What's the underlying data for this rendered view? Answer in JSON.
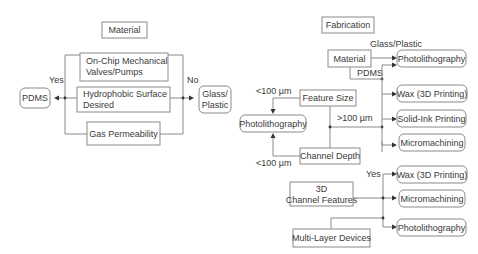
{
  "left_panel": {
    "title": "Material",
    "criteria": [
      {
        "line1": "On-Chip Mechanical",
        "line2": "Valves/Pumps"
      },
      {
        "line1": "Hydrophobic Surface",
        "line2": "Desired"
      },
      {
        "line1": "Gas Permeability",
        "line2": ""
      }
    ],
    "yes_label": "Yes",
    "no_label": "No",
    "yes_result": "PDMS",
    "no_result_line1": "Glass/",
    "no_result_line2": "Plastic"
  },
  "right_panel": {
    "title": "Fabrication",
    "material_node": "Material",
    "glass_plastic_label": "Glass/Plastic",
    "pdms_label": "PDMS",
    "feature_size": "Feature Size",
    "channel_depth": "Channel Depth",
    "lt100_top": "<100 µm",
    "lt100_bottom": "<100 µm",
    "gt100": ">100 µm",
    "photolithography_left": "Photolithography",
    "methods_top": [
      "Photolithography",
      "Wax (3D Printing)",
      "Solid-Ink Printing",
      "Micromachining"
    ],
    "channel_features_line1": "3D",
    "channel_features_line2": "Channel Features",
    "yes_label": "Yes",
    "multi_layer": "Multi-Layer Devices",
    "methods_bottom": [
      "Wax (3D Printing)",
      "Micromachining",
      "Photolithography"
    ]
  }
}
